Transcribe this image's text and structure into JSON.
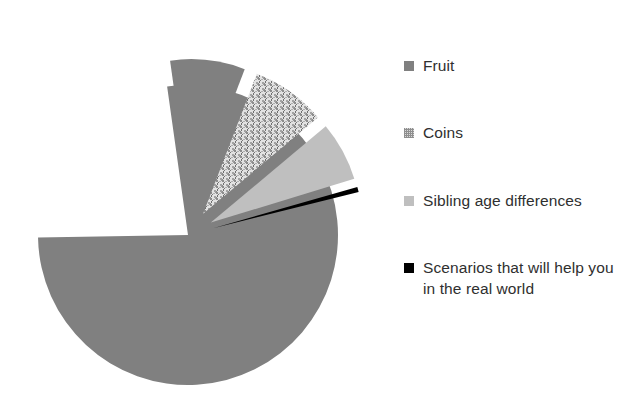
{
  "chart_data": {
    "type": "pie",
    "title": "",
    "subtitle": "",
    "xlabel": "",
    "ylabel": "",
    "grid": false,
    "legend_position": "right",
    "exploded": true,
    "categories": [
      "Fruit",
      "Fruit",
      "Coins",
      "Sibling age differences",
      "Scenarios that will help you in the real world"
    ],
    "labels": [
      "Fruit",
      "Coins",
      "Sibling age differences",
      "Scenarios that will help you in the real world"
    ],
    "values": [
      77,
      8,
      8,
      6.5,
      0.5
    ],
    "slices": [
      {
        "label": "Fruit",
        "value": 77,
        "color": "#808080",
        "pattern": "solid",
        "exploded": false,
        "start_angle_deg": 352,
        "end_angle_deg": 629
      },
      {
        "label": "Fruit",
        "value": 8,
        "color": "#808080",
        "pattern": "solid",
        "exploded": true,
        "start_angle_deg": 352,
        "end_angle_deg": 381
      },
      {
        "label": "Coins",
        "value": 8,
        "color": "#d9d9d9",
        "pattern": "speckle",
        "exploded": true,
        "start_angle_deg": 381,
        "end_angle_deg": 410
      },
      {
        "label": "Sibling age differences",
        "value": 6.5,
        "color": "#bfbfbf",
        "pattern": "solid",
        "exploded": true,
        "start_angle_deg": 410,
        "end_angle_deg": 433
      },
      {
        "label": "Scenarios that will help you in the real world",
        "value": 0.5,
        "color": "#000000",
        "pattern": "solid",
        "exploded": true,
        "start_angle_deg": 434,
        "end_angle_deg": 436
      }
    ],
    "geometry": {
      "center_x": 188,
      "center_y": 235,
      "radius": 150
    }
  },
  "legend": {
    "items": [
      {
        "label": "Fruit",
        "swatch_color": "#808080",
        "swatch_pattern": "solid",
        "icon": "legend-swatch-icon"
      },
      {
        "label": "Coins",
        "swatch_color": "#d9d9d9",
        "swatch_pattern": "speckle",
        "icon": "legend-swatch-icon"
      },
      {
        "label": "Sibling age differences",
        "swatch_color": "#bfbfbf",
        "swatch_pattern": "solid",
        "icon": "legend-swatch-icon"
      },
      {
        "label": "Scenarios that will help you in the real world",
        "swatch_color": "#000000",
        "swatch_pattern": "solid",
        "icon": "legend-swatch-icon"
      }
    ]
  },
  "colors": {
    "background": "#ffffff",
    "fruit": "#808080",
    "coins": "#d9d9d9",
    "sibling": "#bfbfbf",
    "scenarios": "#000000",
    "text": "#2f2f2f"
  }
}
